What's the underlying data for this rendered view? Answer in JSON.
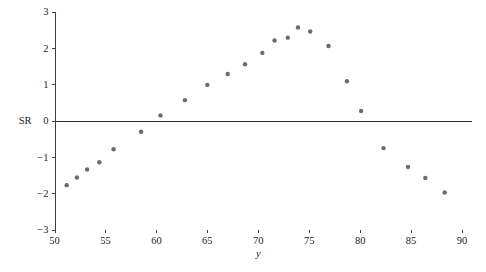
{
  "chart_data": {
    "type": "scatter",
    "title": "",
    "subtitle": "",
    "xlabel": "y",
    "ylabel": "SR",
    "xlim": [
      50,
      90
    ],
    "ylim": [
      -3,
      3
    ],
    "grid": false,
    "legend": null,
    "x_ticks": [
      50,
      55,
      60,
      65,
      70,
      75,
      80,
      85,
      90
    ],
    "x_tick_labels": [
      "50",
      "55",
      "60",
      "65",
      "70",
      "75",
      "80",
      "85",
      "90"
    ],
    "y_ticks": [
      3,
      2,
      1,
      0,
      -1,
      -2,
      -3
    ],
    "y_tick_labels": [
      "3",
      "2",
      "1",
      "0",
      "−1",
      "−2",
      "−3"
    ],
    "zero_reference_line": 0,
    "marker": {
      "shape": "circle",
      "color": "#6b6b6b",
      "radius_px": 2.2
    },
    "series": [
      {
        "name": "SR",
        "points": [
          {
            "x": 51.2,
            "y": -1.78
          },
          {
            "x": 52.2,
            "y": -1.57
          },
          {
            "x": 53.2,
            "y": -1.35
          },
          {
            "x": 54.4,
            "y": -1.15
          },
          {
            "x": 55.8,
            "y": -0.79
          },
          {
            "x": 58.5,
            "y": -0.31
          },
          {
            "x": 60.4,
            "y": 0.14
          },
          {
            "x": 62.8,
            "y": 0.56
          },
          {
            "x": 65.0,
            "y": 0.98
          },
          {
            "x": 67.0,
            "y": 1.28
          },
          {
            "x": 68.7,
            "y": 1.55
          },
          {
            "x": 70.4,
            "y": 1.86
          },
          {
            "x": 71.6,
            "y": 2.2
          },
          {
            "x": 72.9,
            "y": 2.28
          },
          {
            "x": 73.9,
            "y": 2.56
          },
          {
            "x": 75.1,
            "y": 2.45
          },
          {
            "x": 76.9,
            "y": 2.05
          },
          {
            "x": 78.7,
            "y": 1.08
          },
          {
            "x": 80.1,
            "y": 0.26
          },
          {
            "x": 82.3,
            "y": -0.76
          },
          {
            "x": 84.7,
            "y": -1.28
          },
          {
            "x": 86.4,
            "y": -1.58
          },
          {
            "x": 88.3,
            "y": -1.98
          }
        ]
      }
    ]
  },
  "axes": {
    "y_axis_label_text": "SR",
    "x_axis_label_text": "y"
  }
}
